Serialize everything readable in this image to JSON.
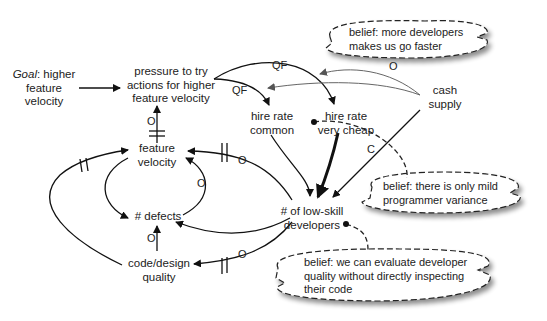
{
  "diagram": {
    "nodes": {
      "goal": {
        "prefix": "Goal",
        "line1_rest": ": higher",
        "line2": "feature",
        "line3": "velocity"
      },
      "pressure": {
        "line1": "pressure to try",
        "line2": "actions for higher",
        "line3": "feature velocity"
      },
      "hire_common": {
        "line1": "hire rate",
        "line2": "common"
      },
      "hire_cheap": {
        "line1": "hire rate",
        "line2": "very cheap"
      },
      "cash": {
        "line1": "cash",
        "line2": "supply"
      },
      "feature_velocity": {
        "line1": "feature",
        "line2": "velocity"
      },
      "defects": {
        "line1": "# defects"
      },
      "low_skill": {
        "line1": "# of low-skill",
        "line2": "developers"
      },
      "code_quality": {
        "line1": "code/design",
        "line2": "quality"
      }
    },
    "edge_labels": {
      "qf_top": "QF",
      "qf_left": "QF",
      "o_cash": "O",
      "c_cash": "C",
      "o_pressure": "O",
      "o_fv": "O",
      "o_loop": "O",
      "o_defects": "O",
      "o_quality": "O"
    },
    "beliefs": {
      "b1": {
        "line1": "belief: more developers",
        "line2": "makes us go faster"
      },
      "b2": {
        "line1": "belief: there is only mild",
        "line2": "programmer variance"
      },
      "b3": {
        "line1": "belief: we can evaluate developer",
        "line2": "quality without directly inspecting",
        "line3": "their code"
      }
    }
  }
}
